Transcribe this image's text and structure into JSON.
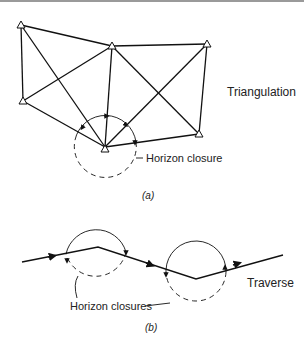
{
  "figure_a": {
    "label": "Triangulation",
    "annotation": "Horizon closure",
    "caption": "(a)",
    "stations": [
      {
        "id": "A",
        "x": 21,
        "y": 25
      },
      {
        "id": "B",
        "x": 112,
        "y": 46
      },
      {
        "id": "C",
        "x": 207,
        "y": 44
      },
      {
        "id": "D",
        "x": 23,
        "y": 101
      },
      {
        "id": "E",
        "x": 105,
        "y": 147
      },
      {
        "id": "F",
        "x": 199,
        "y": 134
      }
    ],
    "lines": [
      [
        "A",
        "B"
      ],
      [
        "A",
        "D"
      ],
      [
        "A",
        "E"
      ],
      [
        "B",
        "C"
      ],
      [
        "B",
        "D"
      ],
      [
        "B",
        "E"
      ],
      [
        "B",
        "F"
      ],
      [
        "C",
        "E"
      ],
      [
        "C",
        "F"
      ],
      [
        "D",
        "E"
      ],
      [
        "E",
        "F"
      ]
    ],
    "closure_circle": {
      "cx": 105,
      "cy": 147,
      "r": 31
    }
  },
  "figure_b": {
    "label": "Traverse",
    "annotation": "Horizon closures",
    "caption": "(b)",
    "path": [
      {
        "x": 22,
        "y": 262
      },
      {
        "x": 98,
        "y": 247
      },
      {
        "x": 196,
        "y": 279
      },
      {
        "x": 283,
        "y": 255
      }
    ],
    "closure_circles": [
      {
        "cx": 96,
        "cy": 248,
        "r": 31
      },
      {
        "cx": 196,
        "cy": 278,
        "r": 30
      }
    ]
  }
}
